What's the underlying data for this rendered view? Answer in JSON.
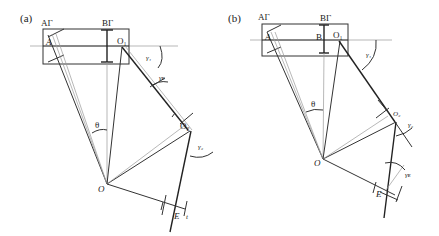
{
  "panels": [
    {
      "id": "a",
      "label": "(a)",
      "points": {
        "Ar": "AΓ",
        "A": "A",
        "Br": "BΓ",
        "O1": "O₁",
        "O2": "O₂",
        "O": "O",
        "E": "E"
      },
      "angles": {
        "theta": "θ",
        "gamma1": "γ₁",
        "gamma2": "γ₂",
        "gammaE": "γᴇ"
      },
      "extra": {
        "t": "t"
      }
    },
    {
      "id": "b",
      "label": "(b)",
      "points": {
        "Ar": "AΓ",
        "A": "A",
        "B": "B",
        "Br": "BΓ",
        "O1": "O₁",
        "O2": "O₂",
        "O": "O",
        "E": "E"
      },
      "angles": {
        "theta": "θ",
        "gamma1": "γ₁",
        "gamma2": "γ₂",
        "gammaE": "γᴇ"
      }
    }
  ]
}
